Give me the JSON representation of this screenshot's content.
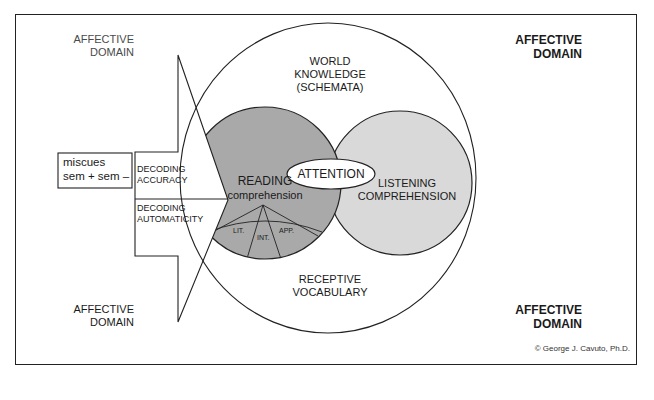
{
  "figure": {
    "affective_domain_labels": [
      {
        "position": "top-left",
        "line1": "AFFECTIVE",
        "line2": "DOMAIN",
        "style": "light"
      },
      {
        "position": "top-right",
        "line1": "AFFECTIVE",
        "line2": "DOMAIN",
        "style": "bold"
      },
      {
        "position": "bottom-left",
        "line1": "AFFECTIVE",
        "line2": "DOMAIN",
        "style": "regular"
      },
      {
        "position": "bottom-right",
        "line1": "AFFECTIVE",
        "line2": "DOMAIN",
        "style": "bold"
      }
    ],
    "world_knowledge": {
      "line1": "WORLD",
      "line2": "KNOWLEDGE",
      "line3": "(SCHEMATA)"
    },
    "receptive_vocabulary": {
      "line1": "RECEPTIVE",
      "line2": "VOCABULARY"
    },
    "miscues_box": {
      "line1": "miscues",
      "line2": "sem + sem –"
    },
    "arrow": {
      "upper": {
        "line1": "DECODING",
        "line2": "ACCURACY"
      },
      "lower": {
        "line1": "DECODING",
        "line2": "AUTOMATICITY"
      }
    },
    "reading_circle": {
      "line1": "READING",
      "line2": "comprehension",
      "fill": "#a9a9a9",
      "segments": [
        {
          "label": "LIT."
        },
        {
          "label": "INT."
        },
        {
          "label": "APP."
        }
      ]
    },
    "attention": {
      "label": "ATTENTION"
    },
    "listening_circle": {
      "line1": "LISTENING",
      "line2": "COMPREHENSION",
      "fill": "#d9d9d9"
    },
    "copyright": "© George J. Cavuto, Ph.D."
  }
}
